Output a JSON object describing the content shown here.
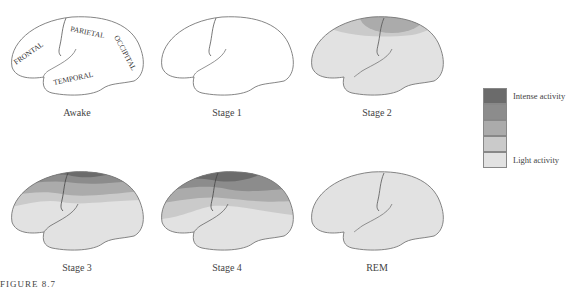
{
  "figure": {
    "label": "FIGURE 8.7"
  },
  "lobes": {
    "frontal": "FRONTAL",
    "parietal": "PARIETAL",
    "occipital": "OCCIPITAL",
    "temporal": "TEMPORAL"
  },
  "panels": [
    {
      "label": "Awake",
      "activity": "none (outline with lobe labels)"
    },
    {
      "label": "Stage 1",
      "activity": "none"
    },
    {
      "label": "Stage 2",
      "activity": "slight activity at top (parietal/frontal)"
    },
    {
      "label": "Stage 3",
      "activity": "intense at top, graded downward"
    },
    {
      "label": "Stage 4",
      "activity": "most intense, widespread frontal/parietal"
    },
    {
      "label": "REM",
      "activity": "light activity throughout"
    }
  ],
  "legend": {
    "top_label": "Intense activity",
    "bottom_label": "Light activity",
    "colors": [
      "#6b6b6b",
      "#8c8c8c",
      "#ababab",
      "#cacaca",
      "#e2e2e2"
    ]
  },
  "colors": {
    "outline": "#777777",
    "level1": "#6b6b6b",
    "level2": "#8c8c8c",
    "level3": "#ababab",
    "level4": "#cacaca",
    "level5": "#e2e2e2"
  }
}
